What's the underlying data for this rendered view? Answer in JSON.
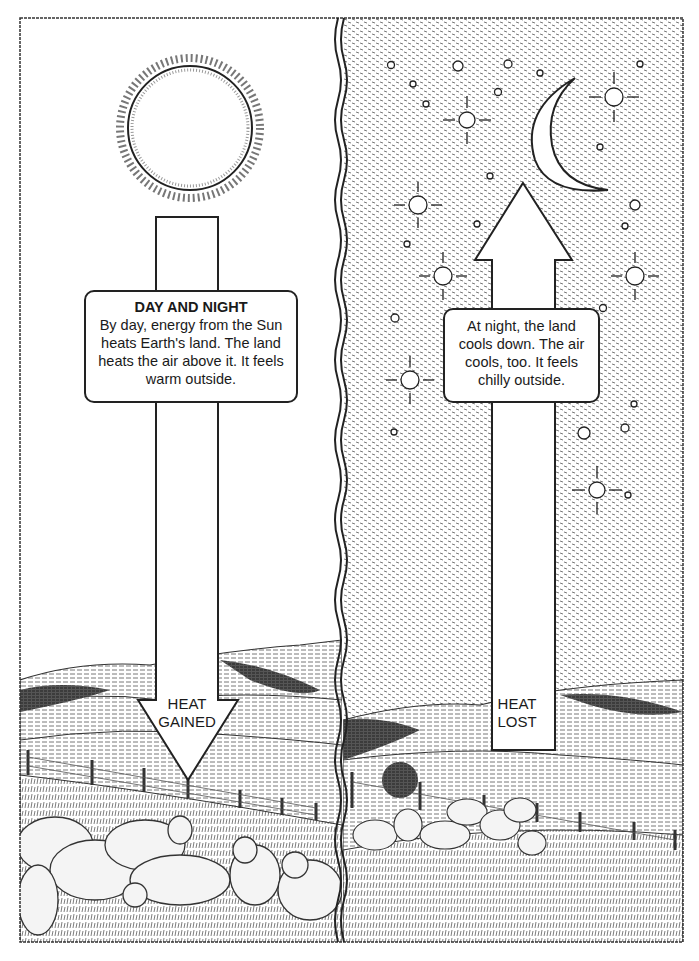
{
  "diagram": {
    "title": "DAY AND NIGHT",
    "panels": [
      {
        "id": "day",
        "caption": "By day, energy from the Sun heats Earth's land. The land heats the air above it. It feels warm outside.",
        "arrow_direction": "down",
        "arrow_label_line1": "HEAT",
        "arrow_label_line2": "GAINED",
        "sky": "white",
        "celestial_body": "sun-icon"
      },
      {
        "id": "night",
        "caption": "At night, the land cools down. The air cools, too. It feels chilly outside.",
        "arrow_direction": "up",
        "arrow_label_line1": "HEAT",
        "arrow_label_line2": "LOST",
        "sky": "stippled-dark",
        "celestial_body": "moon-icon"
      }
    ],
    "scenery": [
      "rolling-hills",
      "fence",
      "sheep"
    ],
    "colors": {
      "ink": "#1a1a1a",
      "paper": "#ffffff",
      "night_stipple": "#9a9a9a"
    }
  }
}
